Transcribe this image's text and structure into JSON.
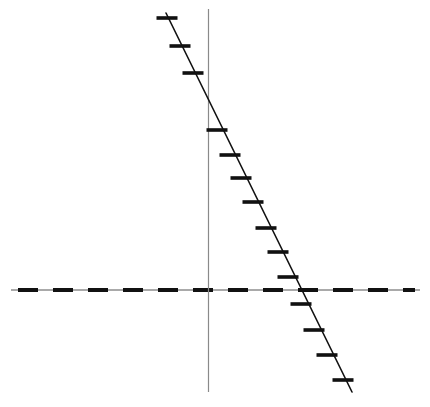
{
  "figure": {
    "width": 430,
    "height": 407,
    "background_color": "#ffffff"
  },
  "chart_data": {
    "type": "scatter",
    "title": "",
    "subtitle": "",
    "xlabel": "",
    "ylabel": "",
    "grid": false,
    "legend": null,
    "legend_position": "none",
    "annotations": [],
    "axis_style": {
      "x_axis": {
        "description": "horizontal dashed axis line",
        "color": "#111111",
        "dash_pattern": "20 15",
        "thickness_px": 4,
        "underlay_color": "#444444",
        "underlay_thickness_px": 1,
        "pixel_y": 290,
        "pixel_x_start": 11,
        "pixel_x_end": 420
      },
      "y_axis": {
        "description": "vertical thin solid axis line",
        "color": "#8a8a8a",
        "thickness_px": 1,
        "pixel_x": 208,
        "pixel_y_start": 9,
        "pixel_y_end": 392
      }
    },
    "fit_line": {
      "name": "descending trend line",
      "color": "#111111",
      "thickness_px": 1.6,
      "pixel_start": [
        166,
        13
      ],
      "pixel_end": [
        352,
        392
      ],
      "slope_pixel": -2.04,
      "x_intercept_pixel": 308,
      "y_intercept_pixel": 99
    },
    "marker_style": {
      "shape": "horizontal-dash",
      "width_px": 21,
      "height_px": 3.6,
      "color": "#111111"
    },
    "x": [
      166,
      179,
      191,
      200,
      213,
      224,
      234,
      245,
      255,
      265,
      276,
      286,
      297,
      308,
      318,
      330,
      343
    ],
    "y": [
      18,
      46,
      73,
      100,
      130,
      155,
      178,
      202,
      228,
      252,
      277,
      304,
      330,
      355,
      380,
      380,
      380
    ],
    "points_pixel": [
      [
        167,
        18
      ],
      [
        180,
        46
      ],
      [
        193,
        73
      ],
      [
        217,
        130
      ],
      [
        230,
        155
      ],
      [
        241,
        178
      ],
      [
        253,
        202
      ],
      [
        266,
        228
      ],
      [
        278,
        252
      ],
      [
        288,
        277
      ],
      [
        301,
        304
      ],
      [
        314,
        330
      ],
      [
        327,
        355
      ],
      [
        343,
        380
      ]
    ],
    "point_count": 14,
    "missing_marker_near_origin": true,
    "values": [
      18,
      46,
      73,
      130,
      155,
      178,
      202,
      228,
      252,
      277,
      304,
      330,
      355,
      380
    ],
    "categories": [
      "p1",
      "p2",
      "p3",
      "p4",
      "p5",
      "p6",
      "p7",
      "p8",
      "p9",
      "p10",
      "p11",
      "p12",
      "p13",
      "p14"
    ],
    "xlim": [
      0,
      430
    ],
    "ylim": [
      0,
      407
    ]
  }
}
